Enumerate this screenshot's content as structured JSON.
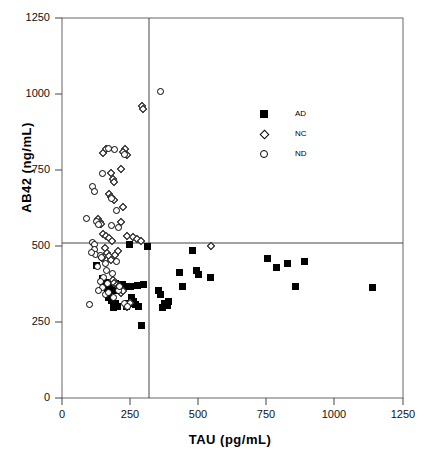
{
  "chart_data": {
    "type": "scatter",
    "title": "",
    "xlabel": "TAU  (pg/mL)",
    "ylabel": "AB42  (ng/mL)",
    "xlim": [
      0,
      1250
    ],
    "ylim": [
      0,
      1250
    ],
    "xticks": [
      0,
      250,
      500,
      750,
      1000,
      1250
    ],
    "yticks": [
      0,
      250,
      500,
      750,
      1000,
      1250
    ],
    "xtick_labels": [
      "0",
      "250",
      "500",
      "750",
      "1000",
      "1250"
    ],
    "ytick_labels": [
      "0",
      "250",
      "500",
      "750",
      "1000",
      "1250"
    ],
    "grid": false,
    "legend_position": "upper-right-inside",
    "reference_lines": {
      "vertical_x": 320,
      "horizontal_y": 510
    },
    "legend": [
      {
        "label": "AD",
        "marker": "filled-square"
      },
      {
        "label": "NC",
        "marker": "open-diamond"
      },
      {
        "label": "ND",
        "marker": "open-circle"
      }
    ],
    "series": [
      {
        "name": "AD",
        "marker": "filled-square",
        "points": [
          [
            125,
            435
          ],
          [
            150,
            393
          ],
          [
            158,
            380
          ],
          [
            170,
            368
          ],
          [
            178,
            372
          ],
          [
            165,
            345
          ],
          [
            172,
            332
          ],
          [
            182,
            322
          ],
          [
            190,
            298
          ],
          [
            196,
            312
          ],
          [
            202,
            300
          ],
          [
            188,
            355
          ],
          [
            196,
            378
          ],
          [
            205,
            372
          ],
          [
            212,
            360
          ],
          [
            220,
            372
          ],
          [
            228,
            366
          ],
          [
            236,
            300
          ],
          [
            242,
            312
          ],
          [
            248,
            505
          ],
          [
            250,
            368
          ],
          [
            255,
            330
          ],
          [
            262,
            318
          ],
          [
            268,
            308
          ],
          [
            275,
            370
          ],
          [
            282,
            302
          ],
          [
            292,
            240
          ],
          [
            300,
            372
          ],
          [
            312,
            500
          ],
          [
            352,
            352
          ],
          [
            362,
            340
          ],
          [
            368,
            298
          ],
          [
            375,
            312
          ],
          [
            385,
            305
          ],
          [
            392,
            318
          ],
          [
            432,
            412
          ],
          [
            440,
            368
          ],
          [
            480,
            485
          ],
          [
            492,
            418
          ],
          [
            500,
            405
          ],
          [
            545,
            398
          ],
          [
            752,
            458
          ],
          [
            788,
            430
          ],
          [
            825,
            442
          ],
          [
            855,
            368
          ],
          [
            888,
            448
          ],
          [
            1140,
            362
          ]
        ]
      },
      {
        "name": "NC",
        "marker": "open-diamond",
        "points": [
          [
            152,
            805
          ],
          [
            160,
            818
          ],
          [
            232,
            818
          ],
          [
            238,
            800
          ],
          [
            222,
            808
          ],
          [
            292,
            962
          ],
          [
            296,
            952
          ],
          [
            178,
            740
          ],
          [
            186,
            722
          ],
          [
            190,
            710
          ],
          [
            218,
            752
          ],
          [
            172,
            672
          ],
          [
            180,
            660
          ],
          [
            190,
            652
          ],
          [
            132,
            588
          ],
          [
            138,
            578
          ],
          [
            142,
            572
          ],
          [
            225,
            628
          ],
          [
            215,
            578
          ],
          [
            150,
            538
          ],
          [
            160,
            532
          ],
          [
            172,
            525
          ],
          [
            182,
            515
          ],
          [
            240,
            532
          ],
          [
            262,
            528
          ],
          [
            276,
            522
          ],
          [
            288,
            518
          ],
          [
            158,
            492
          ],
          [
            166,
            478
          ],
          [
            172,
            468
          ],
          [
            178,
            455
          ],
          [
            186,
            388
          ],
          [
            192,
            378
          ],
          [
            200,
            372
          ],
          [
            210,
            368
          ],
          [
            215,
            345
          ],
          [
            222,
            352
          ],
          [
            240,
            300
          ],
          [
            248,
            312
          ],
          [
            545,
            500
          ],
          [
            148,
            460
          ],
          [
            196,
            472
          ],
          [
            205,
            482
          ]
        ]
      },
      {
        "name": "ND",
        "marker": "open-circle",
        "points": [
          [
            362,
            1008
          ],
          [
            172,
            822
          ],
          [
            192,
            818
          ],
          [
            228,
            800
          ],
          [
            150,
            738
          ],
          [
            110,
            695
          ],
          [
            120,
            678
          ],
          [
            180,
            655
          ],
          [
            200,
            618
          ],
          [
            208,
            562
          ],
          [
            90,
            592
          ],
          [
            128,
            582
          ],
          [
            132,
            572
          ],
          [
            182,
            568
          ],
          [
            112,
            512
          ],
          [
            118,
            505
          ],
          [
            120,
            488
          ],
          [
            122,
            472
          ],
          [
            140,
            468
          ],
          [
            146,
            462
          ],
          [
            108,
            478
          ],
          [
            158,
            442
          ],
          [
            200,
            448
          ],
          [
            162,
            418
          ],
          [
            152,
            395
          ],
          [
            140,
            382
          ],
          [
            168,
            378
          ],
          [
            148,
            362
          ],
          [
            208,
            352
          ],
          [
            190,
            330
          ],
          [
            228,
            312
          ],
          [
            240,
            300
          ],
          [
            100,
            308
          ],
          [
            135,
            352
          ],
          [
            158,
            340
          ],
          [
            172,
            348
          ],
          [
            212,
            368
          ],
          [
            186,
            410
          ],
          [
            130,
            432
          ]
        ]
      }
    ]
  }
}
